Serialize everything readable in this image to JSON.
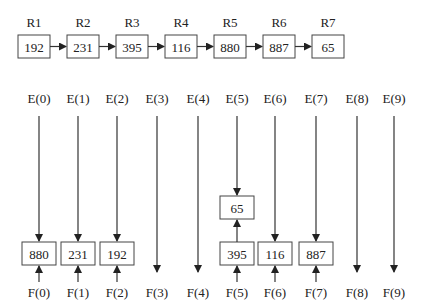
{
  "records": [
    {
      "label": "R1",
      "value": "192"
    },
    {
      "label": "R2",
      "value": "231"
    },
    {
      "label": "R3",
      "value": "395"
    },
    {
      "label": "R4",
      "value": "116"
    },
    {
      "label": "R5",
      "value": "880"
    },
    {
      "label": "R6",
      "value": "887"
    },
    {
      "label": "R7",
      "value": "65"
    }
  ],
  "buckets": [
    {
      "e": "E(0)",
      "f": "F(0)",
      "items": [
        "880"
      ]
    },
    {
      "e": "E(1)",
      "f": "F(1)",
      "items": [
        "231"
      ]
    },
    {
      "e": "E(2)",
      "f": "F(2)",
      "items": [
        "192"
      ]
    },
    {
      "e": "E(3)",
      "f": "F(3)",
      "items": []
    },
    {
      "e": "E(4)",
      "f": "F(4)",
      "items": []
    },
    {
      "e": "E(5)",
      "f": "F(5)",
      "items": [
        "395",
        "65"
      ]
    },
    {
      "e": "E(6)",
      "f": "F(6)",
      "items": [
        "116"
      ]
    },
    {
      "e": "E(7)",
      "f": "F(7)",
      "items": [
        "887"
      ]
    },
    {
      "e": "E(8)",
      "f": "F(8)",
      "items": []
    },
    {
      "e": "E(9)",
      "f": "F(9)",
      "items": []
    }
  ]
}
